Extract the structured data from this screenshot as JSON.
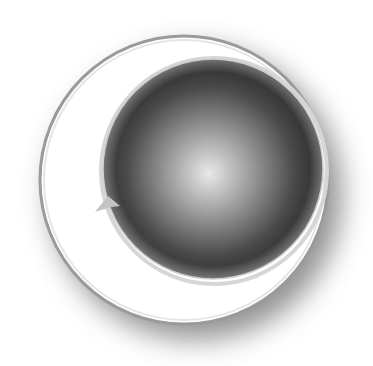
{
  "figure": {
    "colors": {
      "background": "#ffffff",
      "outer_disc_fill": "#ffffff",
      "outer_disc_border": "#9a9a9a",
      "shadow": "#6e6e6e",
      "sphere_center": "#ececec",
      "sphere_mid": "#8a8a8a",
      "sphere_edge": "#222222",
      "sphere_rim": "#cfcfcf",
      "arrow": "#c4c4c4"
    },
    "outer_disc": {
      "cx": 184,
      "cy": 180,
      "r": 145
    },
    "inner_sphere": {
      "cx": 213,
      "cy": 169,
      "r": 110,
      "highlight_cx": 210,
      "highlight_cy": 170
    },
    "arrow": {
      "direction": "right",
      "tip_x": 120,
      "tip_y": 206
    }
  }
}
